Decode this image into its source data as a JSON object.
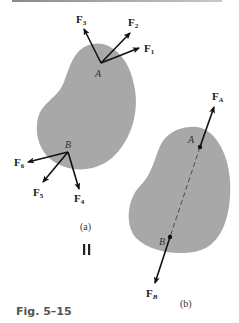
{
  "figure": {
    "caption": "Fig. 5–15",
    "subfig_a_label": "(a)",
    "subfig_b_label": "(b)",
    "equivalence_symbol": "II",
    "body_color": "#a8a8a8",
    "arrow_color": "#111111"
  },
  "panel_a": {
    "point_A": "A",
    "point_B": "B",
    "forces_at_A": [
      {
        "name": "F",
        "sub": "1"
      },
      {
        "name": "F",
        "sub": "2"
      },
      {
        "name": "F",
        "sub": "3"
      }
    ],
    "forces_at_B": [
      {
        "name": "F",
        "sub": "4"
      },
      {
        "name": "F",
        "sub": "5"
      },
      {
        "name": "F",
        "sub": "6"
      }
    ]
  },
  "panel_b": {
    "point_A": "A",
    "point_B": "B",
    "force_A": {
      "name": "F",
      "sub": "A"
    },
    "force_B": {
      "name": "F",
      "sub": "B"
    }
  }
}
